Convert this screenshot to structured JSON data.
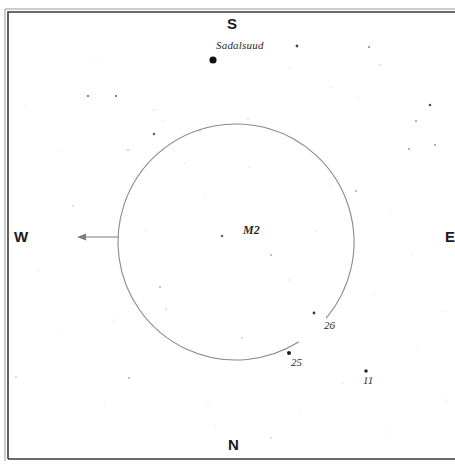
{
  "chart": {
    "type": "star-chart",
    "background_color": "#ffffff",
    "frame": {
      "x": 8,
      "y": 12,
      "right": 455,
      "bottom": 459,
      "color": "#3b3b3b",
      "outer_color": "#9a9a9a"
    },
    "cardinals": {
      "south": "S",
      "north": "N",
      "west": "W",
      "east": "E"
    },
    "field_circle": {
      "cx": 236,
      "cy": 242,
      "r": 118,
      "color": "#8a8a8a",
      "stroke_width": 1.1,
      "gap_start_deg": 40,
      "gap_end_deg": 58,
      "note": "telescope field of view circle with small break near star 26"
    },
    "direction_arrow": {
      "points_to": "W",
      "x_start": 118,
      "x_end": 77,
      "y": 237,
      "color": "#7d7d7d"
    },
    "labeled_stars": [
      {
        "name": "Sadalsuud",
        "label": "Sadalsuud",
        "x": 213,
        "y": 60,
        "r": 3.6,
        "color": "#111111"
      },
      {
        "name": "M2",
        "label": "M2",
        "x": 222,
        "y": 236,
        "r": 1.3,
        "color": "#6a6a6a"
      },
      {
        "name": "26",
        "label": "26",
        "x": 314,
        "y": 313,
        "r": 1.4,
        "color": "#3a3a3a"
      },
      {
        "name": "25",
        "label": "25",
        "x": 289,
        "y": 353,
        "r": 2.0,
        "color": "#1c1c1c"
      },
      {
        "name": "11",
        "label": "11",
        "x": 366,
        "y": 371,
        "r": 1.8,
        "color": "#2a2a2a"
      }
    ],
    "field_stars": [
      {
        "x": 297,
        "y": 46,
        "r": 1.4,
        "o": 0.85
      },
      {
        "x": 369,
        "y": 47,
        "r": 1.0,
        "o": 0.55
      },
      {
        "x": 380,
        "y": 65,
        "r": 0.7,
        "o": 0.3
      },
      {
        "x": 331,
        "y": 87,
        "r": 0.6,
        "o": 0.25
      },
      {
        "x": 430,
        "y": 105,
        "r": 1.3,
        "o": 0.8
      },
      {
        "x": 416,
        "y": 121,
        "r": 0.9,
        "o": 0.5
      },
      {
        "x": 409,
        "y": 149,
        "r": 0.9,
        "o": 0.5
      },
      {
        "x": 435,
        "y": 145,
        "r": 1.0,
        "o": 0.45
      },
      {
        "x": 290,
        "y": 68,
        "r": 0.6,
        "o": 0.25
      },
      {
        "x": 357,
        "y": 99,
        "r": 0.6,
        "o": 0.22
      },
      {
        "x": 88,
        "y": 96,
        "r": 1.1,
        "o": 0.7
      },
      {
        "x": 116,
        "y": 96,
        "r": 1.1,
        "o": 0.7
      },
      {
        "x": 154,
        "y": 134,
        "r": 1.2,
        "o": 0.75
      },
      {
        "x": 128,
        "y": 150,
        "r": 0.8,
        "o": 0.4
      },
      {
        "x": 73,
        "y": 206,
        "r": 0.8,
        "o": 0.35
      },
      {
        "x": 154,
        "y": 110,
        "r": 0.7,
        "o": 0.3
      },
      {
        "x": 163,
        "y": 121,
        "r": 0.6,
        "o": 0.22
      },
      {
        "x": 200,
        "y": 131,
        "r": 0.8,
        "o": 0.35
      },
      {
        "x": 185,
        "y": 163,
        "r": 0.6,
        "o": 0.25
      },
      {
        "x": 248,
        "y": 119,
        "r": 0.7,
        "o": 0.3
      },
      {
        "x": 249,
        "y": 167,
        "r": 0.6,
        "o": 0.22
      },
      {
        "x": 271,
        "y": 255,
        "r": 0.9,
        "o": 0.4
      },
      {
        "x": 290,
        "y": 280,
        "r": 0.7,
        "o": 0.28
      },
      {
        "x": 160,
        "y": 287,
        "r": 0.9,
        "o": 0.42
      },
      {
        "x": 166,
        "y": 309,
        "r": 0.8,
        "o": 0.35
      },
      {
        "x": 242,
        "y": 338,
        "r": 0.8,
        "o": 0.35
      },
      {
        "x": 146,
        "y": 230,
        "r": 0.6,
        "o": 0.22
      },
      {
        "x": 205,
        "y": 197,
        "r": 0.6,
        "o": 0.2
      },
      {
        "x": 316,
        "y": 231,
        "r": 0.6,
        "o": 0.22
      },
      {
        "x": 331,
        "y": 185,
        "r": 0.6,
        "o": 0.2
      },
      {
        "x": 356,
        "y": 191,
        "r": 0.9,
        "o": 0.42
      },
      {
        "x": 390,
        "y": 213,
        "r": 0.6,
        "o": 0.22
      },
      {
        "x": 412,
        "y": 254,
        "r": 0.6,
        "o": 0.2
      },
      {
        "x": 375,
        "y": 294,
        "r": 0.6,
        "o": 0.2
      },
      {
        "x": 343,
        "y": 383,
        "r": 0.6,
        "o": 0.22
      },
      {
        "x": 418,
        "y": 349,
        "r": 0.6,
        "o": 0.2
      },
      {
        "x": 16,
        "y": 377,
        "r": 0.8,
        "o": 0.35
      },
      {
        "x": 129,
        "y": 378,
        "r": 0.9,
        "o": 0.4
      },
      {
        "x": 38,
        "y": 270,
        "r": 0.6,
        "o": 0.2
      },
      {
        "x": 105,
        "y": 405,
        "r": 0.6,
        "o": 0.22
      },
      {
        "x": 208,
        "y": 406,
        "r": 0.6,
        "o": 0.2
      },
      {
        "x": 271,
        "y": 438,
        "r": 0.8,
        "o": 0.35
      },
      {
        "x": 300,
        "y": 412,
        "r": 0.6,
        "o": 0.2
      },
      {
        "x": 215,
        "y": 425,
        "r": 0.6,
        "o": 0.18
      },
      {
        "x": 60,
        "y": 330,
        "r": 0.6,
        "o": 0.18
      },
      {
        "x": 113,
        "y": 320,
        "r": 0.6,
        "o": 0.18
      },
      {
        "x": 388,
        "y": 432,
        "r": 0.6,
        "o": 0.18
      },
      {
        "x": 443,
        "y": 311,
        "r": 0.6,
        "o": 0.2
      },
      {
        "x": 447,
        "y": 400,
        "r": 0.6,
        "o": 0.18
      },
      {
        "x": 96,
        "y": 56,
        "r": 0.6,
        "o": 0.2
      },
      {
        "x": 62,
        "y": 150,
        "r": 0.6,
        "o": 0.18
      },
      {
        "x": 26,
        "y": 105,
        "r": 0.6,
        "o": 0.18
      }
    ]
  }
}
